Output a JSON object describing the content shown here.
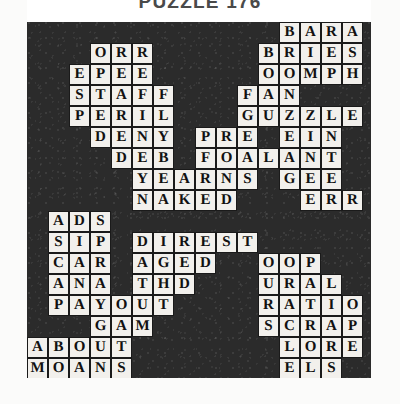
{
  "title": "PUZZLE 176",
  "colors": {
    "grid_background": "#2b2b2b",
    "cell_fill": "#f2f0ec",
    "cell_border": "#1a1a1a",
    "letter": "#111111",
    "page_background": "#ffffff",
    "title_text": "#4a4a4a"
  },
  "grid": {
    "columns": 16,
    "rows": 17,
    "cell_size": 21,
    "origin_x": 27,
    "origin_y": 22
  },
  "entries": [
    {
      "name": "bara",
      "text": "BARA",
      "row": 0,
      "col": 12,
      "dir": "across"
    },
    {
      "name": "orr",
      "text": "ORR",
      "row": 1,
      "col": 3,
      "dir": "across"
    },
    {
      "name": "bries",
      "text": "BRIES",
      "row": 1,
      "col": 11,
      "dir": "across"
    },
    {
      "name": "epee",
      "text": "EPEE",
      "row": 2,
      "col": 2,
      "dir": "across"
    },
    {
      "name": "oomph",
      "text": "OOMPH",
      "row": 2,
      "col": 11,
      "dir": "across"
    },
    {
      "name": "staff",
      "text": "STAFF",
      "row": 3,
      "col": 2,
      "dir": "across"
    },
    {
      "name": "fan",
      "text": "FAN",
      "row": 3,
      "col": 10,
      "dir": "across"
    },
    {
      "name": "peril",
      "text": "PERIL",
      "row": 4,
      "col": 2,
      "dir": "across"
    },
    {
      "name": "guzzle",
      "text": "GUZZLE",
      "row": 4,
      "col": 10,
      "dir": "across"
    },
    {
      "name": "deny",
      "text": "DENY",
      "row": 5,
      "col": 3,
      "dir": "across"
    },
    {
      "name": "pre",
      "text": "PRE",
      "row": 5,
      "col": 8,
      "dir": "across"
    },
    {
      "name": "ein",
      "text": "EIN",
      "row": 5,
      "col": 12,
      "dir": "across"
    },
    {
      "name": "deb",
      "text": "DEB",
      "row": 6,
      "col": 4,
      "dir": "across"
    },
    {
      "name": "foal",
      "text": "FOAL",
      "row": 6,
      "col": 8,
      "dir": "across"
    },
    {
      "name": "ant",
      "text": "ANT",
      "row": 6,
      "col": 12,
      "dir": "across"
    },
    {
      "name": "yearns",
      "text": "YEARNS",
      "row": 7,
      "col": 5,
      "dir": "across"
    },
    {
      "name": "gee",
      "text": "GEE",
      "row": 7,
      "col": 12,
      "dir": "across"
    },
    {
      "name": "naked",
      "text": "NAKED",
      "row": 8,
      "col": 5,
      "dir": "across"
    },
    {
      "name": "err",
      "text": "ERR",
      "row": 8,
      "col": 13,
      "dir": "across"
    },
    {
      "name": "ads",
      "text": "ADS",
      "row": 9,
      "col": 1,
      "dir": "across"
    },
    {
      "name": "sip",
      "text": "SIP",
      "row": 10,
      "col": 1,
      "dir": "across"
    },
    {
      "name": "direst",
      "text": "DIREST",
      "row": 10,
      "col": 5,
      "dir": "across"
    },
    {
      "name": "car",
      "text": "CAR",
      "row": 11,
      "col": 1,
      "dir": "across"
    },
    {
      "name": "aged",
      "text": "AGED",
      "row": 11,
      "col": 5,
      "dir": "across"
    },
    {
      "name": "oop",
      "text": "OOP",
      "row": 11,
      "col": 11,
      "dir": "across"
    },
    {
      "name": "ana",
      "text": "ANA",
      "row": 12,
      "col": 1,
      "dir": "across"
    },
    {
      "name": "thd",
      "text": "THD",
      "row": 12,
      "col": 5,
      "dir": "across"
    },
    {
      "name": "ural",
      "text": "URAL",
      "row": 12,
      "col": 11,
      "dir": "across"
    },
    {
      "name": "payout",
      "text": "PAYOUT",
      "row": 13,
      "col": 1,
      "dir": "across"
    },
    {
      "name": "ratio",
      "text": "RATIO",
      "row": 13,
      "col": 11,
      "dir": "across"
    },
    {
      "name": "gam",
      "text": "GAM",
      "row": 14,
      "col": 3,
      "dir": "across"
    },
    {
      "name": "scrap",
      "text": "SCRAP",
      "row": 14,
      "col": 11,
      "dir": "across"
    },
    {
      "name": "about",
      "text": "ABOUT",
      "row": 15,
      "col": 0,
      "dir": "across"
    },
    {
      "name": "lore",
      "text": "LORE",
      "row": 15,
      "col": 12,
      "dir": "across"
    },
    {
      "name": "moans",
      "text": "MOANS",
      "row": 16,
      "col": 0,
      "dir": "across"
    },
    {
      "name": "els",
      "text": "ELS",
      "row": 16,
      "col": 12,
      "dir": "across"
    },
    {
      "name": "pars",
      "text": "PARS",
      "row": 17,
      "col": 0,
      "dir": "across"
    }
  ]
}
